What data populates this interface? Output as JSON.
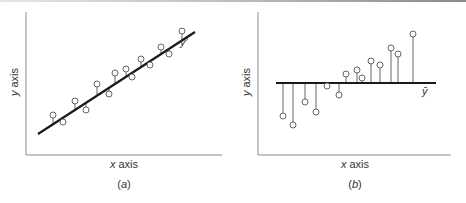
{
  "panels": [
    {
      "id": "a",
      "caption": "(a)",
      "caption_letter": "a",
      "x_axis_label": "x axis",
      "y_axis_label": "y axis",
      "line_label": "y′",
      "line_type": "regression",
      "line": {
        "x1": 38,
        "y1": 134,
        "x2": 195,
        "y2": 32
      },
      "points": [
        [
          53,
          115
        ],
        [
          63,
          122
        ],
        [
          75,
          101
        ],
        [
          86,
          110
        ],
        [
          97,
          84
        ],
        [
          109,
          94
        ],
        [
          115,
          73
        ],
        [
          126,
          69
        ],
        [
          132,
          77
        ],
        [
          141,
          59
        ],
        [
          150,
          65
        ],
        [
          161,
          47
        ],
        [
          169,
          54
        ],
        [
          182,
          31
        ]
      ]
    },
    {
      "id": "b",
      "caption": "(b)",
      "caption_letter": "b",
      "x_axis_label": "x axis",
      "y_axis_label": "y axis",
      "line_label": "ȳ",
      "line_type": "mean",
      "line": {
        "x1": 276,
        "y1": 83,
        "x2": 436,
        "y2": 83
      },
      "points": [
        [
          283,
          116
        ],
        [
          293,
          125
        ],
        [
          305,
          102
        ],
        [
          316,
          112
        ],
        [
          327,
          86
        ],
        [
          339,
          95
        ],
        [
          346,
          74
        ],
        [
          357,
          70
        ],
        [
          362,
          78
        ],
        [
          371,
          61
        ],
        [
          380,
          65
        ],
        [
          391,
          48
        ],
        [
          398,
          54
        ],
        [
          413,
          34
        ]
      ]
    }
  ],
  "colors": {
    "line": "#1a1a1a",
    "axis": "#8c8c8c",
    "marker_stroke": "#555555",
    "stem": "#555555"
  }
}
